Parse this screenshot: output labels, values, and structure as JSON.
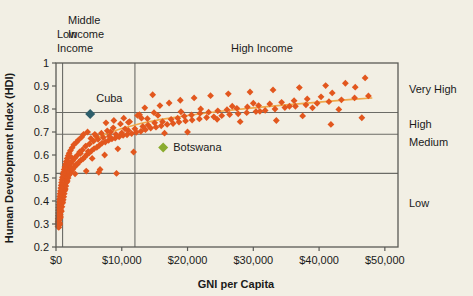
{
  "chart_data": {
    "type": "scatter",
    "title": "",
    "xlabel": "GNI per Capita",
    "ylabel": "Human Development Index (HDI)",
    "xlim": [
      0,
      52000
    ],
    "ylim": [
      0.2,
      1.0
    ],
    "grid": true,
    "legend_position": "none",
    "x_ticks": [
      0,
      10000,
      20000,
      30000,
      40000,
      50000
    ],
    "x_tick_labels": [
      "$0",
      "$10,000",
      "$20,000",
      "$30,000",
      "$40,000",
      "$50,000"
    ],
    "y_ticks": [
      0.2,
      0.3,
      0.4,
      0.5,
      0.6,
      0.7,
      0.8,
      0.9,
      1
    ],
    "y_tick_labels": [
      "0.2",
      "0.3",
      "0.4",
      "0.5",
      "0.6",
      "0.7",
      "0.8",
      "0.9",
      "1"
    ],
    "income_bands": [
      {
        "label": "Low\nIncome",
        "label_lines": [
          "Low",
          "Income"
        ],
        "x_start": 0,
        "x_end": 1000
      },
      {
        "label": "Middle\nIncome",
        "label_lines": [
          "Middle",
          "Income"
        ],
        "x_start": 1000,
        "x_end": 12000
      },
      {
        "label": "High Income",
        "label_lines": [
          "High Income"
        ],
        "x_start": 12000,
        "x_end": 52000
      }
    ],
    "hdi_bands": [
      {
        "label": "Very High",
        "y_min": 0.785,
        "y_max": 1.0
      },
      {
        "label": "High",
        "y_min": 0.69,
        "y_max": 0.785
      },
      {
        "label": "Medium",
        "y_min": 0.52,
        "y_max": 0.69
      },
      {
        "label": "Low",
        "y_min": 0.2,
        "y_max": 0.52
      }
    ],
    "band_dividers_x": [
      1000,
      12000
    ],
    "band_dividers_y": [
      0.785,
      0.69,
      0.52
    ],
    "series": [
      {
        "name": "Countries",
        "color": "#e2571e",
        "marker": "diamond",
        "points": [
          [
            420,
            0.285
          ],
          [
            480,
            0.295
          ],
          [
            520,
            0.305
          ],
          [
            450,
            0.315
          ],
          [
            560,
            0.3
          ],
          [
            600,
            0.325
          ],
          [
            530,
            0.335
          ],
          [
            650,
            0.34
          ],
          [
            700,
            0.33
          ],
          [
            620,
            0.35
          ],
          [
            760,
            0.36
          ],
          [
            680,
            0.37
          ],
          [
            820,
            0.355
          ],
          [
            900,
            0.375
          ],
          [
            740,
            0.385
          ],
          [
            960,
            0.39
          ],
          [
            880,
            0.4
          ],
          [
            1030,
            0.395
          ],
          [
            800,
            0.41
          ],
          [
            1100,
            0.405
          ],
          [
            1180,
            0.418
          ],
          [
            950,
            0.425
          ],
          [
            1250,
            0.432
          ],
          [
            1050,
            0.44
          ],
          [
            1330,
            0.445
          ],
          [
            1420,
            0.452
          ],
          [
            1160,
            0.46
          ],
          [
            1500,
            0.465
          ],
          [
            1280,
            0.473
          ],
          [
            1600,
            0.48
          ],
          [
            1720,
            0.487
          ],
          [
            1390,
            0.495
          ],
          [
            1840,
            0.5
          ],
          [
            1510,
            0.508
          ],
          [
            1960,
            0.512
          ],
          [
            2100,
            0.518
          ],
          [
            1650,
            0.523
          ],
          [
            2250,
            0.527
          ],
          [
            1790,
            0.53
          ],
          [
            2400,
            0.535
          ],
          [
            2600,
            0.54
          ],
          [
            1920,
            0.545
          ],
          [
            2800,
            0.548
          ],
          [
            2080,
            0.552
          ],
          [
            3000,
            0.556
          ],
          [
            3250,
            0.56
          ],
          [
            2300,
            0.565
          ],
          [
            3500,
            0.57
          ],
          [
            2550,
            0.575
          ],
          [
            3800,
            0.578
          ],
          [
            4100,
            0.583
          ],
          [
            2900,
            0.588
          ],
          [
            4400,
            0.592
          ],
          [
            3200,
            0.598
          ],
          [
            4700,
            0.602
          ],
          [
            5000,
            0.608
          ],
          [
            3600,
            0.613
          ],
          [
            5400,
            0.618
          ],
          [
            4000,
            0.622
          ],
          [
            5800,
            0.628
          ],
          [
            6200,
            0.633
          ],
          [
            4500,
            0.638
          ],
          [
            6600,
            0.642
          ],
          [
            5100,
            0.648
          ],
          [
            7000,
            0.652
          ],
          [
            7500,
            0.656
          ],
          [
            5700,
            0.66
          ],
          [
            8000,
            0.664
          ],
          [
            6400,
            0.668
          ],
          [
            8500,
            0.67
          ],
          [
            9000,
            0.673
          ],
          [
            7200,
            0.676
          ],
          [
            9600,
            0.679
          ],
          [
            8100,
            0.682
          ],
          [
            10200,
            0.685
          ],
          [
            10800,
            0.688
          ],
          [
            9100,
            0.69
          ],
          [
            11500,
            0.693
          ],
          [
            10000,
            0.696
          ],
          [
            12200,
            0.699
          ],
          [
            12900,
            0.703
          ],
          [
            11000,
            0.707
          ],
          [
            13600,
            0.71
          ],
          [
            12000,
            0.714
          ],
          [
            14400,
            0.717
          ],
          [
            15200,
            0.721
          ],
          [
            13200,
            0.724
          ],
          [
            16000,
            0.727
          ],
          [
            14000,
            0.73
          ],
          [
            16900,
            0.733
          ],
          [
            17800,
            0.737
          ],
          [
            15000,
            0.74
          ],
          [
            18700,
            0.743
          ],
          [
            16200,
            0.745
          ],
          [
            19700,
            0.748
          ],
          [
            20700,
            0.752
          ],
          [
            17500,
            0.755
          ],
          [
            21800,
            0.757
          ],
          [
            18500,
            0.76
          ],
          [
            22900,
            0.763
          ],
          [
            24000,
            0.766
          ],
          [
            19500,
            0.769
          ],
          [
            25200,
            0.771
          ],
          [
            20600,
            0.774
          ],
          [
            26400,
            0.776
          ],
          [
            27700,
            0.779
          ],
          [
            21900,
            0.781
          ],
          [
            29000,
            0.784
          ],
          [
            23200,
            0.786
          ],
          [
            30400,
            0.789
          ],
          [
            24600,
            0.792
          ],
          [
            31800,
            0.794
          ],
          [
            26000,
            0.797
          ],
          [
            33300,
            0.8
          ],
          [
            27500,
            0.803
          ],
          [
            34800,
            0.806
          ],
          [
            29100,
            0.809
          ],
          [
            36400,
            0.812
          ],
          [
            30800,
            0.815
          ],
          [
            38000,
            0.818
          ],
          [
            32500,
            0.822
          ],
          [
            39700,
            0.825
          ],
          [
            34300,
            0.829
          ],
          [
            41500,
            0.832
          ],
          [
            36200,
            0.836
          ],
          [
            43400,
            0.84
          ],
          [
            38200,
            0.844
          ],
          [
            45400,
            0.848
          ],
          [
            40300,
            0.853
          ],
          [
            47500,
            0.857
          ],
          [
            13500,
            0.805
          ],
          [
            15800,
            0.815
          ],
          [
            17200,
            0.826
          ],
          [
            18900,
            0.838
          ],
          [
            21000,
            0.848
          ],
          [
            23500,
            0.858
          ],
          [
            26200,
            0.866
          ],
          [
            29500,
            0.874
          ],
          [
            33000,
            0.883
          ],
          [
            37000,
            0.893
          ],
          [
            41000,
            0.902
          ],
          [
            44000,
            0.912
          ],
          [
            47000,
            0.935
          ],
          [
            45500,
            0.895
          ],
          [
            42000,
            0.87
          ],
          [
            14700,
            0.862
          ],
          [
            12700,
            0.775
          ],
          [
            13900,
            0.758
          ],
          [
            11200,
            0.745
          ],
          [
            9800,
            0.735
          ],
          [
            8700,
            0.718
          ],
          [
            7800,
            0.705
          ],
          [
            6900,
            0.695
          ],
          [
            6100,
            0.683
          ],
          [
            5300,
            0.672
          ],
          [
            4800,
            0.7
          ],
          [
            4200,
            0.69
          ],
          [
            3900,
            0.678
          ],
          [
            3400,
            0.665
          ],
          [
            3100,
            0.655
          ],
          [
            2700,
            0.645
          ],
          [
            2450,
            0.632
          ],
          [
            2200,
            0.62
          ],
          [
            2000,
            0.608
          ],
          [
            1850,
            0.597
          ],
          [
            1700,
            0.585
          ],
          [
            1560,
            0.572
          ],
          [
            1440,
            0.56
          ],
          [
            1340,
            0.548
          ],
          [
            1240,
            0.537
          ],
          [
            1140,
            0.525
          ],
          [
            1060,
            0.515
          ],
          [
            980,
            0.503
          ],
          [
            910,
            0.492
          ],
          [
            850,
            0.48
          ],
          [
            790,
            0.468
          ],
          [
            730,
            0.456
          ],
          [
            670,
            0.444
          ],
          [
            610,
            0.432
          ],
          [
            560,
            0.42
          ],
          [
            510,
            0.408
          ],
          [
            470,
            0.396
          ],
          [
            440,
            0.384
          ],
          [
            410,
            0.372
          ],
          [
            390,
            0.36
          ],
          [
            370,
            0.348
          ],
          [
            350,
            0.336
          ],
          [
            330,
            0.324
          ],
          [
            320,
            0.312
          ],
          [
            310,
            0.3
          ],
          [
            300,
            0.29
          ],
          [
            350,
            0.305
          ],
          [
            400,
            0.318
          ],
          [
            460,
            0.33
          ],
          [
            520,
            0.343
          ],
          [
            5500,
            0.585
          ],
          [
            7400,
            0.6
          ],
          [
            9400,
            0.627
          ],
          [
            4600,
            0.53
          ],
          [
            6700,
            0.537
          ],
          [
            11800,
            0.613
          ],
          [
            20000,
            0.7
          ],
          [
            37500,
            0.77
          ],
          [
            41800,
            0.733
          ],
          [
            46500,
            0.762
          ],
          [
            33500,
            0.75
          ],
          [
            28000,
            0.745
          ],
          [
            16500,
            0.695
          ],
          [
            24500,
            0.755
          ],
          [
            31000,
            0.79
          ],
          [
            35500,
            0.812
          ],
          [
            39000,
            0.805
          ],
          [
            43000,
            0.798
          ],
          [
            30000,
            0.825
          ],
          [
            26800,
            0.812
          ],
          [
            22000,
            0.8
          ],
          [
            19000,
            0.788
          ],
          [
            15500,
            0.772
          ],
          [
            13000,
            0.76
          ],
          [
            10500,
            0.714
          ],
          [
            8800,
            0.75
          ],
          [
            7600,
            0.74
          ],
          [
            10300,
            0.76
          ],
          [
            12400,
            0.772
          ],
          [
            14900,
            0.784
          ],
          [
            9200,
            0.52
          ],
          [
            6500,
            0.525
          ],
          [
            4900,
            0.616
          ],
          [
            3700,
            0.607
          ],
          [
            2900,
            0.518
          ],
          [
            1950,
            0.57
          ],
          [
            2350,
            0.59
          ],
          [
            5900,
            0.69
          ],
          [
            8300,
            0.7
          ],
          [
            11000,
            0.742
          ]
        ]
      }
    ],
    "highlighted_points": [
      {
        "label": "Cuba",
        "x": 5200,
        "y": 0.778,
        "color": "#2e5f6b",
        "marker": "diamond",
        "label_dx": 6,
        "label_dy": -12
      },
      {
        "label": "Botswana",
        "x": 16300,
        "y": 0.633,
        "color": "#8aab2e",
        "marker": "diamond",
        "label_dx": 10,
        "label_dy": 4
      }
    ],
    "trendline": {
      "color": "#f0a84a",
      "points": [
        [
          1200,
          0.47
        ],
        [
          2000,
          0.545
        ],
        [
          3000,
          0.598
        ],
        [
          4500,
          0.645
        ],
        [
          6000,
          0.672
        ],
        [
          8000,
          0.697
        ],
        [
          10000,
          0.715
        ],
        [
          13000,
          0.738
        ],
        [
          16000,
          0.755
        ],
        [
          20000,
          0.772
        ],
        [
          25000,
          0.79
        ],
        [
          30000,
          0.805
        ],
        [
          35000,
          0.818
        ],
        [
          40000,
          0.83
        ],
        [
          45000,
          0.842
        ],
        [
          48000,
          0.848
        ]
      ]
    },
    "colors": {
      "background": "#f2efe4",
      "marker": "#e2571e",
      "cuba": "#2e5f6b",
      "botswana": "#8aab2e",
      "trendline": "#f0a84a",
      "axis": "#5a5a55",
      "grid": "#6b6b66",
      "text": "#1a1a1a"
    }
  }
}
